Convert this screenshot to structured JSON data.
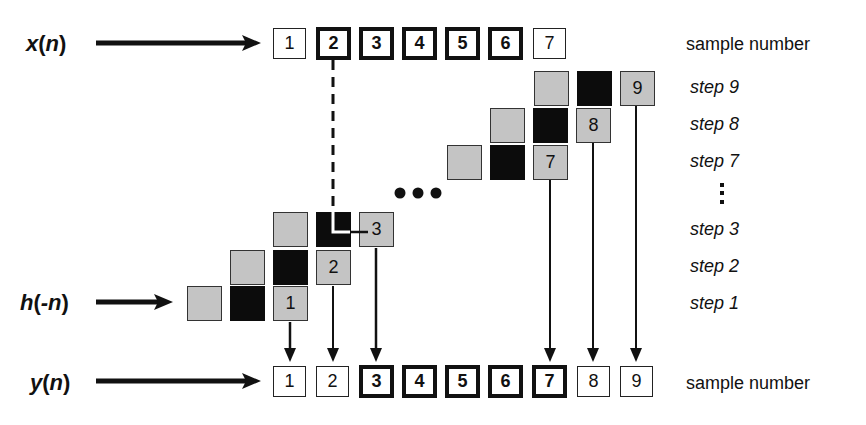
{
  "signals": {
    "x": {
      "name": "x",
      "open": "(",
      "arg": "n",
      "close": ")"
    },
    "h": {
      "name": "h",
      "open": "(",
      "arg": "-n",
      "close": ")"
    },
    "y": {
      "name": "y",
      "open": "(",
      "arg": "n",
      "close": ")"
    }
  },
  "x_samples": [
    {
      "label": "1",
      "style": "thin"
    },
    {
      "label": "2",
      "style": "thick"
    },
    {
      "label": "3",
      "style": "thick"
    },
    {
      "label": "4",
      "style": "thick"
    },
    {
      "label": "5",
      "style": "thick"
    },
    {
      "label": "6",
      "style": "thick"
    },
    {
      "label": "7",
      "style": "thin"
    }
  ],
  "y_samples": [
    {
      "label": "1",
      "style": "thin"
    },
    {
      "label": "2",
      "style": "thin"
    },
    {
      "label": "3",
      "style": "thick"
    },
    {
      "label": "4",
      "style": "thick"
    },
    {
      "label": "5",
      "style": "thick"
    },
    {
      "label": "6",
      "style": "thick"
    },
    {
      "label": "7",
      "style": "thick"
    },
    {
      "label": "8",
      "style": "thin"
    },
    {
      "label": "9",
      "style": "thin"
    }
  ],
  "steps": [
    {
      "label": "step 1",
      "output": "1"
    },
    {
      "label": "step 2",
      "output": "2"
    },
    {
      "label": "step 3",
      "output": "3"
    },
    {
      "label": "step 7",
      "output": "7"
    },
    {
      "label": "step 8",
      "output": "8"
    },
    {
      "label": "step 9",
      "output": "9"
    }
  ],
  "right_labels": {
    "top": "sample number",
    "bottom": "sample number",
    "vertical_ellipsis": "⋮"
  },
  "ellipsis": "•••",
  "colors": {
    "kernel_gray": "#c4c4c4",
    "kernel_black": "#0c0c0c",
    "line": "#111111"
  }
}
